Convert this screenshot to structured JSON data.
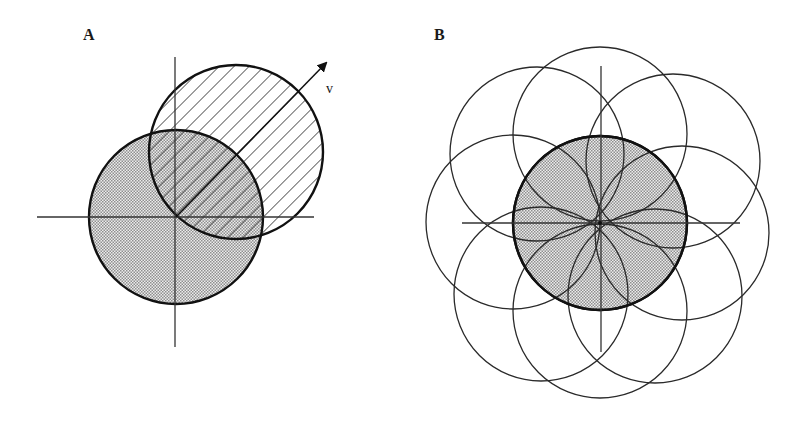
{
  "figure": {
    "panels": [
      {
        "id": "A",
        "label": "A",
        "vector_label": "v",
        "description": "Shaded circle centered at origin, overlapped by hatched circle displaced along vector v",
        "origin": [
          176,
          217
        ],
        "radius": 87,
        "shaded_circle_center": [
          176,
          217
        ],
        "hatched_circle_center": [
          236,
          152
        ],
        "vector_tip": [
          328,
          61
        ]
      },
      {
        "id": "B",
        "label": "B",
        "description": "Shaded central circle with eight unshaded circles of equal radius passing through the origin",
        "origin": [
          600,
          223
        ],
        "radius": 87,
        "outer_circle_centers": [
          [
            600,
            134
          ],
          [
            537,
            154
          ],
          [
            673,
            161
          ],
          [
            513,
            222
          ],
          [
            682,
            233
          ],
          [
            541,
            294
          ],
          [
            600,
            311
          ],
          [
            655,
            296
          ]
        ]
      }
    ],
    "colors": {
      "stroke": "#111111",
      "stipple_dark": "#9a9a9a",
      "stipple_light": "#f2f2f2",
      "background": "#ffffff"
    }
  }
}
